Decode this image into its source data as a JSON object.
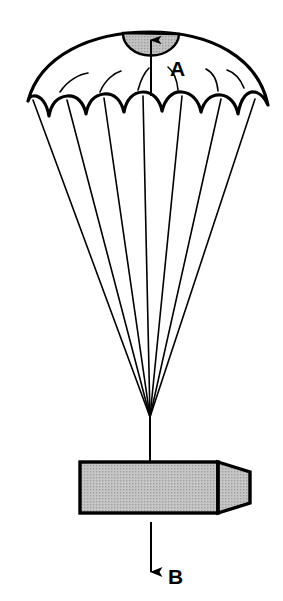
{
  "figure": {
    "name": "parachute-descent-diagram",
    "width": 283,
    "height": 601,
    "background_color": "#ffffff",
    "line_color": "#000000",
    "fill_gray": "#b8b8b8",
    "canopy_fill": "#ffffff"
  },
  "labels": {
    "apex_vent": {
      "text": "A",
      "x": 170,
      "y": 76,
      "arrow_direction": "up",
      "description": "arrow pointing up through apex vent"
    },
    "payload_motion": {
      "text": "B",
      "x": 172,
      "y": 584,
      "arrow_direction": "down",
      "description": "arrow pointing down below payload"
    }
  },
  "canopy": {
    "name": "parachute-canopy",
    "apex_x": 150,
    "apex_y": 32,
    "left_tip_x": 28,
    "left_tip_y": 101,
    "right_tip_x": 268,
    "right_tip_y": 105,
    "scallop_count": 6,
    "seam_arc_count": 5
  },
  "vent": {
    "name": "apex-vent",
    "shape": "half-ellipse",
    "center_x": 151,
    "top_y": 33,
    "radius_x": 28,
    "radius_y": 22,
    "fill": "#b8b8b8",
    "texture": "halftone-dots"
  },
  "suspension": {
    "name": "suspension-lines",
    "line_count": 7,
    "confluence_x": 150,
    "confluence_y": 417,
    "riser_bottom_y": 463
  },
  "payload": {
    "name": "payload-box",
    "left": 80,
    "top": 462,
    "right_body": 218,
    "nose_tip": 250,
    "bottom": 513,
    "fill": "#b8b8b8",
    "texture": "halftone-dots",
    "stroke_width": 3,
    "shape": "rectangular body with tapered nose"
  },
  "arrows": {
    "apex_arrow": {
      "name": "apex-vent-arrow",
      "x": 151,
      "y_tail": 96,
      "y_head": 33
    },
    "payload_arrow": {
      "name": "payload-descent-arrow",
      "x": 151,
      "y_tail": 522,
      "y_head": 580
    }
  }
}
